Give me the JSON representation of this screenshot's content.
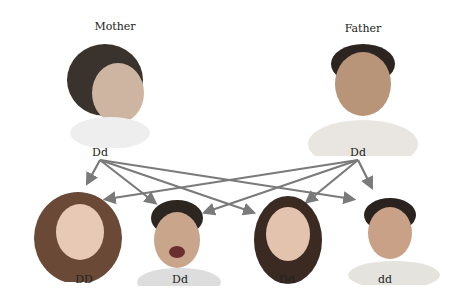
{
  "parents": [
    {
      "role": "Mother",
      "genotype": "Dd"
    },
    {
      "role": "Father",
      "genotype": "Dd"
    }
  ],
  "children": [
    {
      "genotype": "DD"
    },
    {
      "genotype": "Dd"
    },
    {
      "genotype": "Dd"
    },
    {
      "genotype": "dd"
    }
  ],
  "colors": {
    "arrow": "#7a7a7a",
    "text": "#222222"
  }
}
